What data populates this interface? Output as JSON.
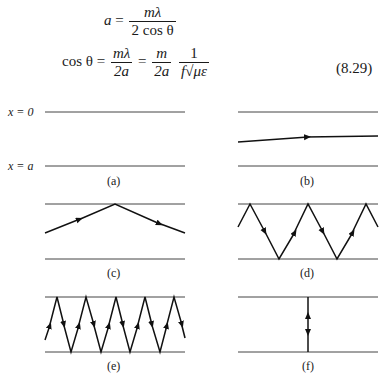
{
  "equations": {
    "eq1": {
      "lhs": "a",
      "equals": "=",
      "num": "mλ",
      "den": "2 cos θ"
    },
    "eq2": {
      "lhs": "cos θ",
      "equals1": "=",
      "num1": "mλ",
      "den1": "2a",
      "equals2": "=",
      "num2": "m",
      "den2": "2a",
      "num3": "1",
      "den3_f": "f",
      "den3_sqrt": "√",
      "den3_radicand": "με"
    },
    "number": "(8.29)"
  },
  "figure": {
    "wall_labels": {
      "top": "x = 0",
      "bottom": "x = a"
    },
    "panels": [
      {
        "id": "a",
        "caption": "(a)"
      },
      {
        "id": "b",
        "caption": "(b)"
      },
      {
        "id": "c",
        "caption": "(c)"
      },
      {
        "id": "d",
        "caption": "(d)"
      },
      {
        "id": "e",
        "caption": "(e)"
      },
      {
        "id": "f",
        "caption": "(f)"
      }
    ]
  }
}
